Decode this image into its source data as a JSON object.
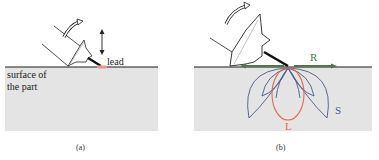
{
  "panels": [
    {
      "id": "a",
      "caption": "(a)",
      "labels": {
        "lead": "lead",
        "surface_line1": "surface of",
        "surface_line2": "the part"
      },
      "icons": [
        "curved-rotation-arrow-icon",
        "vertical-double-arrow-icon",
        "ultrasonic-probe-icon"
      ]
    },
    {
      "id": "b",
      "caption": "(b)",
      "labels": {
        "rayleigh": "R",
        "shear": "S",
        "longitudinal": "L"
      },
      "icons": [
        "curved-rotation-arrow-icon",
        "ultrasonic-probe-icon"
      ]
    }
  ],
  "colors": {
    "part_fill": "#e4e4e4",
    "surface_line": "#1a1a1a",
    "lead_contact": "#e8735a",
    "rayleigh_wave": "#4e7a48",
    "shear_wave": "#4a5a8a",
    "longitudinal_wave": "#e06a50"
  }
}
